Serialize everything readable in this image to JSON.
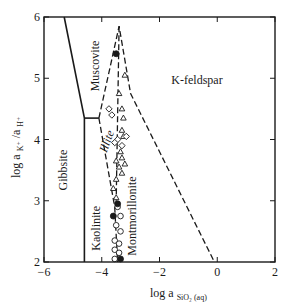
{
  "chart_data": {
    "type": "scatter",
    "title": "",
    "xlabel": "log a SiO2(aq)",
    "xlabel_main": "log a",
    "xlabel_sub": "SiO₂ (aq)",
    "ylabel": "log a K+ / a H+",
    "ylabel_main": "log a",
    "ylabel_k": "K⁺",
    "ylabel_sep": " /a",
    "ylabel_h": "H⁺",
    "xlim": [
      -6,
      2
    ],
    "ylim": [
      2,
      6
    ],
    "grid": false,
    "legend": "none",
    "x_ticks": [
      -6,
      -4,
      -2,
      0,
      2
    ],
    "x_tick_labels": [
      "−6",
      "−4",
      "−2",
      "0",
      "2"
    ],
    "y_ticks": [
      2,
      3,
      4,
      5,
      6
    ],
    "y_tick_labels": [
      "2",
      "3",
      "4",
      "5",
      "6"
    ],
    "regions": [
      {
        "name": "Gibbsite",
        "x": -5.2,
        "y": 3.5,
        "rotate": -90
      },
      {
        "name": "Muscovite",
        "x": -4.1,
        "y": 5.2,
        "rotate": -90
      },
      {
        "name": "Illite",
        "x": -3.7,
        "y": 3.95,
        "rotate": -70,
        "italic": true
      },
      {
        "name": "K-feldspar",
        "x": -0.7,
        "y": 4.9,
        "rotate": 0
      },
      {
        "name": "Kaolinite",
        "x": -4.05,
        "y": 2.55,
        "rotate": -90
      },
      {
        "name": "Montmorillonite",
        "x": -2.8,
        "y": 2.75,
        "rotate": -90
      }
    ],
    "boundaries": [
      {
        "style": "solid",
        "points": [
          [
            -5.3,
            6
          ],
          [
            -4.6,
            4.35
          ],
          [
            -4.6,
            2
          ]
        ]
      },
      {
        "style": "solid",
        "points": [
          [
            -4.6,
            4.35
          ],
          [
            -4.1,
            4.35
          ]
        ]
      },
      {
        "style": "dashed",
        "points": [
          [
            -4.1,
            4.35
          ],
          [
            -3.4,
            5.85
          ],
          [
            -3.0,
            4.75
          ],
          [
            -0.1,
            2
          ]
        ]
      },
      {
        "style": "dashed",
        "points": [
          [
            -4.1,
            4.35
          ],
          [
            -3.55,
            2.9
          ],
          [
            -3.45,
            2
          ]
        ]
      },
      {
        "style": "dashed",
        "points": [
          [
            -3.4,
            5.85
          ],
          [
            -3.5,
            3.0
          ]
        ]
      }
    ],
    "series": [
      {
        "name": "open triangles",
        "marker": "triangle-open",
        "points": [
          [
            -3.2,
            5.05
          ],
          [
            -3.4,
            4.75
          ],
          [
            -3.3,
            4.5
          ],
          [
            -3.25,
            4.35
          ],
          [
            -3.3,
            4.15
          ],
          [
            -3.25,
            4.05
          ],
          [
            -3.35,
            3.8
          ],
          [
            -3.5,
            3.65
          ],
          [
            -3.3,
            3.7
          ],
          [
            -3.4,
            3.55
          ],
          [
            -3.2,
            3.6
          ],
          [
            -3.3,
            3.45
          ],
          [
            -3.5,
            3.35
          ],
          [
            -3.6,
            3.2
          ],
          [
            -3.5,
            3.05
          ]
        ]
      },
      {
        "name": "open diamonds",
        "marker": "diamond-open",
        "points": [
          [
            -3.75,
            4.5
          ],
          [
            -3.65,
            4.4
          ],
          [
            -3.45,
            4.0
          ],
          [
            -3.55,
            3.95
          ],
          [
            -3.15,
            4.05
          ],
          [
            -3.3,
            3.9
          ]
        ]
      },
      {
        "name": "open circles",
        "marker": "circle-open",
        "points": [
          [
            -3.45,
            2.9
          ],
          [
            -3.35,
            2.75
          ],
          [
            -3.5,
            2.6
          ],
          [
            -3.35,
            2.5
          ],
          [
            -3.55,
            2.35
          ],
          [
            -3.4,
            2.3
          ],
          [
            -3.55,
            2.2
          ],
          [
            -3.4,
            2.15
          ],
          [
            -3.55,
            2.05
          ]
        ]
      },
      {
        "name": "filled circles",
        "marker": "circle-filled",
        "points": [
          [
            -3.5,
            5.4
          ],
          [
            -3.45,
            2.95
          ],
          [
            -3.6,
            2.75
          ],
          [
            -3.35,
            2.05
          ]
        ]
      }
    ]
  }
}
